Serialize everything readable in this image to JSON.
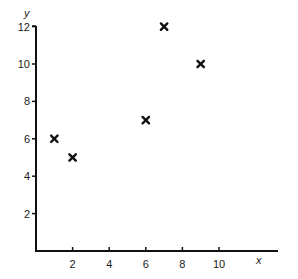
{
  "chart_data": {
    "type": "scatter",
    "title": "",
    "xlabel": "x",
    "ylabel": "y",
    "xlim": [
      0,
      12
    ],
    "ylim": [
      0,
      12
    ],
    "x_ticks": [
      2,
      4,
      6,
      8,
      10
    ],
    "y_ticks": [
      2,
      4,
      6,
      8,
      10,
      12
    ],
    "grid": false,
    "legend": null,
    "marker": "x",
    "marker_color": "#111111",
    "axis_color": "#111111",
    "points": [
      {
        "x": 1,
        "y": 6
      },
      {
        "x": 2,
        "y": 5
      },
      {
        "x": 6,
        "y": 7
      },
      {
        "x": 7,
        "y": 12
      },
      {
        "x": 9,
        "y": 10
      }
    ],
    "x": [
      1,
      2,
      6,
      7,
      9
    ],
    "y": [
      6,
      5,
      7,
      12,
      10
    ]
  }
}
